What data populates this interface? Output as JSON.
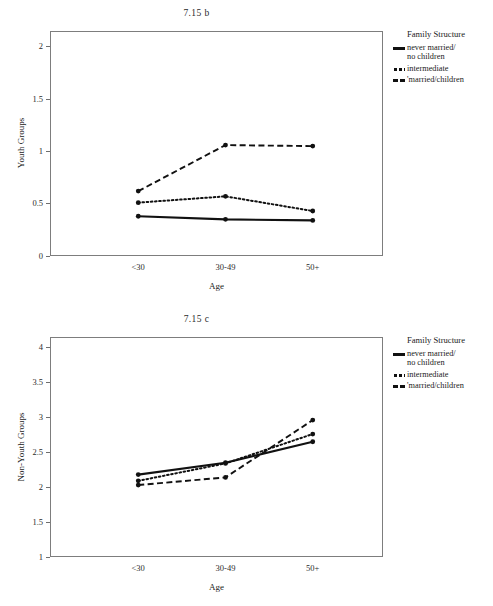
{
  "figures": [
    {
      "id": "b",
      "title": "7.15 b",
      "ylabel": "Non-visible",
      "legend": {
        "title": "Family Structure",
        "items": [
          {
            "name": "never married/no children",
            "line1": "never married/",
            "line2": "no children",
            "style": "solid"
          },
          {
            "name": "intermediate",
            "line1": "intermediate",
            "line2": "",
            "style": "dotted"
          },
          {
            "name": "'married/children",
            "line1": "'married/children",
            "line2": "",
            "style": "dashed"
          }
        ]
      }
    }
  ],
  "chart_data": [
    {
      "type": "line",
      "title": "7.15 b",
      "xlabel": "Age",
      "ylabel": "Youth Groups",
      "categories": [
        "<30",
        "30-49",
        "50+"
      ],
      "yticks": [
        0,
        0.5,
        1,
        1.5,
        2
      ],
      "yticklabels": [
        "0",
        "0.5",
        "1",
        "1.5",
        "2"
      ],
      "ylim": [
        0,
        2.15
      ],
      "grid": false,
      "legend_title": "Family Structure",
      "legend_position": "right",
      "series": [
        {
          "name": "never married/ no children",
          "style": "solid",
          "values": [
            0.38,
            0.35,
            0.34
          ]
        },
        {
          "name": "intermediate",
          "style": "dotted",
          "values": [
            0.51,
            0.57,
            0.43
          ]
        },
        {
          "name": "'married/children",
          "style": "dashed",
          "values": [
            0.62,
            1.06,
            1.05
          ]
        }
      ]
    },
    {
      "type": "line",
      "title": "7.15 c",
      "xlabel": "Age",
      "ylabel": "Non-Youth Groups",
      "categories": [
        "<30",
        "30-49",
        "50+"
      ],
      "yticks": [
        1,
        1.5,
        2,
        2.5,
        3,
        3.5,
        4
      ],
      "yticklabels": [
        "1",
        "1.5",
        "2",
        "2.5",
        "3",
        "3.5",
        "4"
      ],
      "ylim": [
        1,
        4.15
      ],
      "grid": false,
      "legend_title": "Family Structure",
      "legend_position": "right",
      "series": [
        {
          "name": "never married/ no children",
          "style": "solid",
          "values": [
            2.18,
            2.35,
            2.65
          ]
        },
        {
          "name": "intermediate",
          "style": "dotted",
          "values": [
            2.09,
            2.34,
            2.76
          ]
        },
        {
          "name": "'married/children",
          "style": "dashed",
          "values": [
            2.03,
            2.14,
            2.96
          ]
        }
      ]
    }
  ],
  "legend": {
    "title": "Family Structure",
    "items": [
      {
        "line1": "never married/",
        "line2": "no children",
        "style": "solid"
      },
      {
        "line1": "intermediate",
        "line2": "",
        "style": "dotted"
      },
      {
        "line1": "'married/children",
        "line2": "",
        "style": "dashed"
      }
    ]
  }
}
